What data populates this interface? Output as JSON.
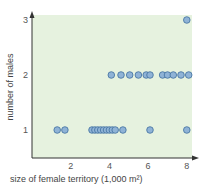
{
  "chart_data": {
    "type": "scatter",
    "title": "",
    "xlabel": "size of female territory (1,000 m²)",
    "ylabel": "number of males",
    "xlim": [
      0,
      8.3
    ],
    "ylim": [
      0.35,
      3.15
    ],
    "xticks": [
      2,
      4,
      6,
      8
    ],
    "yticks": [
      1,
      2,
      3
    ],
    "grid": false,
    "legend": null,
    "series": [
      {
        "name": "territories",
        "points": [
          {
            "x": 1.3,
            "y": 1
          },
          {
            "x": 1.7,
            "y": 1
          },
          {
            "x": 3.1,
            "y": 1
          },
          {
            "x": 3.25,
            "y": 1
          },
          {
            "x": 3.4,
            "y": 1
          },
          {
            "x": 3.55,
            "y": 1
          },
          {
            "x": 3.7,
            "y": 1
          },
          {
            "x": 3.85,
            "y": 1
          },
          {
            "x": 4.0,
            "y": 1
          },
          {
            "x": 4.15,
            "y": 1
          },
          {
            "x": 4.3,
            "y": 1
          },
          {
            "x": 4.7,
            "y": 1
          },
          {
            "x": 6.1,
            "y": 1
          },
          {
            "x": 8.0,
            "y": 1
          },
          {
            "x": 4.1,
            "y": 2
          },
          {
            "x": 4.6,
            "y": 2
          },
          {
            "x": 5.05,
            "y": 2
          },
          {
            "x": 5.5,
            "y": 2
          },
          {
            "x": 5.9,
            "y": 2
          },
          {
            "x": 6.1,
            "y": 2
          },
          {
            "x": 6.75,
            "y": 2
          },
          {
            "x": 7.0,
            "y": 2
          },
          {
            "x": 7.3,
            "y": 2
          },
          {
            "x": 7.7,
            "y": 2
          },
          {
            "x": 8.1,
            "y": 2
          },
          {
            "x": 8.0,
            "y": 3
          }
        ]
      }
    ],
    "colors": {
      "plot_background": "#e6f2df",
      "marker_fill": "#8fb3d6",
      "marker_stroke": "#3f6e9e",
      "axis": "#333333"
    }
  }
}
